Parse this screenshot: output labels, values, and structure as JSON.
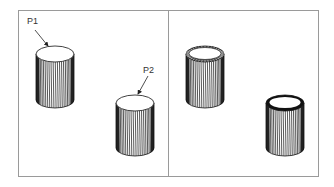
{
  "figure": {
    "frame": {
      "left": 18,
      "top": 10,
      "right": 318,
      "bottom": 176,
      "divider_x": 168,
      "stroke": "#9a9a9a"
    },
    "panels": [
      {
        "name": "before",
        "cylinders": [
          {
            "id": "P1",
            "label": "P1",
            "cx": 55,
            "top": 54,
            "bottom": 100,
            "rx": 19,
            "ry": 8,
            "top_style": "plain",
            "label_pos": [
              27,
              24
            ],
            "arrow_from": [
              35,
              30
            ],
            "arrow_to": [
              48,
              46
            ]
          },
          {
            "id": "P2",
            "label": "P2",
            "cx": 135,
            "top": 103,
            "bottom": 148,
            "rx": 19,
            "ry": 8,
            "top_style": "plain",
            "label_pos": [
              143,
              73
            ],
            "arrow_from": [
              148,
              76
            ],
            "arrow_to": [
              138,
              94
            ]
          }
        ]
      },
      {
        "name": "after",
        "cylinders": [
          {
            "id": "P1-result",
            "cx": 205,
            "top": 54,
            "bottom": 100,
            "rx": 19,
            "ry": 8,
            "top_style": "knurled-rim"
          },
          {
            "id": "P2-result",
            "cx": 285,
            "top": 103,
            "bottom": 148,
            "rx": 19,
            "ry": 8,
            "top_style": "thick-rim"
          }
        ]
      }
    ]
  }
}
